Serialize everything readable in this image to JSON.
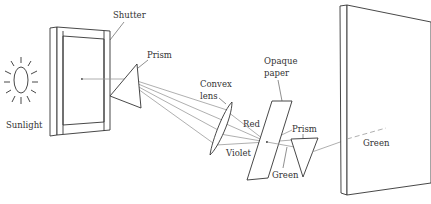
{
  "diagram": {
    "type": "optics-experiment",
    "colors": {
      "ink": "#333333",
      "ray": "#9a9a9a",
      "background": "#ffffff"
    }
  },
  "labels": {
    "sunlight": "Sunlight",
    "shutter": "Shutter",
    "prism1": "Prism",
    "convex_line1": "Convex",
    "convex_line2": "lens",
    "opaque_line1": "Opaque",
    "opaque_line2": "paper",
    "red": "Red",
    "violet": "Violet",
    "prism2": "Prism",
    "green_below": "Green",
    "green_screen": "Green"
  },
  "components": [
    {
      "id": "sun",
      "name": "Sunlight"
    },
    {
      "id": "shutter",
      "name": "Shutter"
    },
    {
      "id": "prism-1",
      "name": "Prism"
    },
    {
      "id": "convex-lens",
      "name": "Convex lens"
    },
    {
      "id": "opaque-paper",
      "name": "Opaque paper"
    },
    {
      "id": "prism-2",
      "name": "Prism"
    },
    {
      "id": "screen",
      "name": "Screen"
    }
  ]
}
